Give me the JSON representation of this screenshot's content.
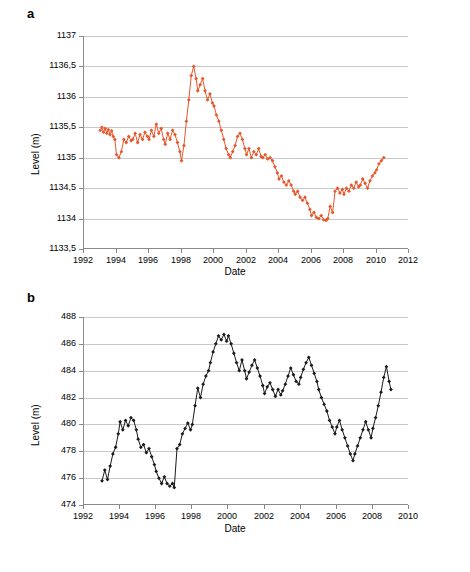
{
  "panels": {
    "a": {
      "letter": "a"
    },
    "b": {
      "letter": "b"
    }
  },
  "chart_data": [
    {
      "panel": "a",
      "type": "line",
      "title": "",
      "xlabel": "Date",
      "ylabel": "Level (m)",
      "xlim": [
        1992,
        2012
      ],
      "ylim": [
        1133.5,
        1137
      ],
      "xticks": [
        "1992",
        "1994",
        "1996",
        "1998",
        "2000",
        "2002",
        "2004",
        "2006",
        "2008",
        "2010",
        "2012"
      ],
      "yticks": [
        "1133,5",
        "1134",
        "1134,5",
        "1135",
        "1135,5",
        "1136",
        "1136,5",
        "1137"
      ],
      "grid": true,
      "legend": "none",
      "color": "#E8572B",
      "marker": "diamond",
      "x": [
        1993.0,
        1993.1,
        1993.2,
        1993.3,
        1993.4,
        1993.5,
        1993.6,
        1993.7,
        1993.8,
        1993.9,
        1994.0,
        1994.15,
        1994.3,
        1994.45,
        1994.6,
        1994.75,
        1994.9,
        1995.0,
        1995.15,
        1995.3,
        1995.45,
        1995.6,
        1995.75,
        1995.9,
        1996.0,
        1996.15,
        1996.3,
        1996.45,
        1996.6,
        1996.75,
        1996.9,
        1997.0,
        1997.15,
        1997.3,
        1997.45,
        1997.6,
        1997.75,
        1997.9,
        1998.0,
        1998.15,
        1998.3,
        1998.45,
        1998.6,
        1998.75,
        1998.9,
        1999.0,
        1999.15,
        1999.3,
        1999.45,
        1999.6,
        1999.75,
        1999.9,
        2000.0,
        2000.15,
        2000.3,
        2000.45,
        2000.6,
        2000.75,
        2000.9,
        2001.0,
        2001.15,
        2001.3,
        2001.45,
        2001.6,
        2001.75,
        2001.9,
        2002.0,
        2002.15,
        2002.3,
        2002.45,
        2002.6,
        2002.75,
        2002.9,
        2003.0,
        2003.15,
        2003.3,
        2003.45,
        2003.6,
        2003.75,
        2003.9,
        2004.0,
        2004.15,
        2004.3,
        2004.45,
        2004.6,
        2004.75,
        2004.9,
        2005.0,
        2005.15,
        2005.3,
        2005.45,
        2005.6,
        2005.75,
        2005.9,
        2006.0,
        2006.15,
        2006.3,
        2006.45,
        2006.6,
        2006.75,
        2006.9,
        2007.0,
        2007.15,
        2007.3,
        2007.45,
        2007.6,
        2007.75,
        2007.9,
        2008.0,
        2008.15,
        2008.3,
        2008.45,
        2008.6,
        2008.75,
        2008.9,
        2009.0,
        2009.15,
        2009.3,
        2009.45,
        2009.6,
        2009.75,
        2009.9,
        2010.0,
        2010.15,
        2010.3,
        2010.45
      ],
      "values": [
        1135.45,
        1135.5,
        1135.42,
        1135.48,
        1135.4,
        1135.46,
        1135.38,
        1135.44,
        1135.35,
        1135.3,
        1135.05,
        1135.0,
        1135.1,
        1135.3,
        1135.25,
        1135.35,
        1135.28,
        1135.3,
        1135.4,
        1135.25,
        1135.38,
        1135.3,
        1135.42,
        1135.35,
        1135.3,
        1135.45,
        1135.35,
        1135.55,
        1135.4,
        1135.48,
        1135.3,
        1135.22,
        1135.4,
        1135.3,
        1135.45,
        1135.38,
        1135.25,
        1135.1,
        1134.95,
        1135.2,
        1135.6,
        1135.95,
        1136.35,
        1136.5,
        1136.3,
        1136.1,
        1136.2,
        1136.3,
        1136.1,
        1135.95,
        1136.05,
        1135.9,
        1135.85,
        1135.7,
        1135.6,
        1135.45,
        1135.3,
        1135.15,
        1135.05,
        1135.0,
        1135.1,
        1135.2,
        1135.35,
        1135.4,
        1135.3,
        1135.15,
        1135.05,
        1135.15,
        1135.0,
        1135.1,
        1135.05,
        1135.15,
        1135.02,
        1135.0,
        1135.05,
        1134.98,
        1135.0,
        1134.95,
        1134.85,
        1134.75,
        1134.65,
        1134.7,
        1134.6,
        1134.55,
        1134.62,
        1134.55,
        1134.45,
        1134.4,
        1134.45,
        1134.35,
        1134.3,
        1134.35,
        1134.25,
        1134.15,
        1134.05,
        1134.1,
        1134.02,
        1134.0,
        1134.05,
        1133.98,
        1133.97,
        1134.0,
        1134.2,
        1134.1,
        1134.45,
        1134.5,
        1134.42,
        1134.48,
        1134.4,
        1134.5,
        1134.45,
        1134.55,
        1134.5,
        1134.6,
        1134.52,
        1134.55,
        1134.65,
        1134.58,
        1134.5,
        1134.62,
        1134.7,
        1134.75,
        1134.8,
        1134.9,
        1134.95,
        1135.0
      ]
    },
    {
      "panel": "b",
      "type": "line",
      "title": "",
      "xlabel": "Date",
      "ylabel": "Level (m)",
      "xlim": [
        1992,
        2010
      ],
      "ylim": [
        474,
        488
      ],
      "xticks": [
        "1992",
        "1994",
        "1996",
        "1998",
        "2000",
        "2002",
        "2004",
        "2006",
        "2008",
        "2010"
      ],
      "yticks": [
        "474",
        "476",
        "478",
        "480",
        "482",
        "484",
        "486",
        "488"
      ],
      "grid": true,
      "legend": "none",
      "color": "#1a1a1a",
      "marker": "diamond",
      "x": [
        1993.0,
        1993.15,
        1993.3,
        1993.45,
        1993.6,
        1993.75,
        1993.9,
        1994.0,
        1994.15,
        1994.3,
        1994.45,
        1994.6,
        1994.75,
        1994.9,
        1995.0,
        1995.15,
        1995.3,
        1995.45,
        1995.6,
        1995.75,
        1995.9,
        1996.0,
        1996.15,
        1996.3,
        1996.45,
        1996.6,
        1996.75,
        1996.9,
        1997.0,
        1997.15,
        1997.3,
        1997.45,
        1997.6,
        1997.75,
        1997.9,
        1998.0,
        1998.15,
        1998.3,
        1998.45,
        1998.6,
        1998.75,
        1998.9,
        1999.0,
        1999.15,
        1999.3,
        1999.45,
        1999.6,
        1999.75,
        1999.9,
        2000.0,
        2000.15,
        2000.3,
        2000.45,
        2000.6,
        2000.75,
        2000.9,
        2001.0,
        2001.15,
        2001.3,
        2001.45,
        2001.6,
        2001.75,
        2001.9,
        2002.0,
        2002.15,
        2002.3,
        2002.45,
        2002.6,
        2002.75,
        2002.9,
        2003.0,
        2003.15,
        2003.3,
        2003.45,
        2003.6,
        2003.75,
        2003.9,
        2004.0,
        2004.15,
        2004.3,
        2004.45,
        2004.6,
        2004.75,
        2004.9,
        2005.0,
        2005.15,
        2005.3,
        2005.45,
        2005.6,
        2005.75,
        2005.9,
        2006.0,
        2006.15,
        2006.3,
        2006.45,
        2006.6,
        2006.75,
        2006.9,
        2007.0,
        2007.15,
        2007.3,
        2007.45,
        2007.6,
        2007.75,
        2007.9,
        2008.0,
        2008.15,
        2008.3,
        2008.45,
        2008.6,
        2008.75,
        2008.9,
        2009.0
      ],
      "values": [
        475.8,
        476.6,
        475.9,
        476.9,
        477.8,
        478.3,
        479.3,
        480.2,
        479.6,
        480.3,
        479.9,
        480.5,
        480.3,
        479.6,
        478.9,
        478.3,
        478.5,
        477.9,
        478.2,
        477.6,
        477.0,
        476.5,
        476.0,
        475.6,
        476.1,
        475.6,
        475.4,
        475.6,
        475.3,
        478.2,
        478.5,
        479.3,
        479.7,
        480.1,
        479.6,
        480.0,
        481.4,
        482.7,
        482.0,
        483.0,
        483.6,
        484.0,
        484.6,
        485.4,
        486.0,
        486.6,
        486.3,
        486.7,
        486.2,
        486.6,
        486.0,
        485.3,
        484.6,
        484.0,
        484.8,
        484.0,
        483.4,
        483.9,
        484.4,
        484.8,
        484.2,
        483.6,
        482.9,
        482.3,
        482.8,
        483.1,
        482.6,
        482.1,
        482.6,
        482.2,
        482.5,
        483.0,
        483.6,
        484.2,
        483.7,
        483.2,
        483.0,
        483.5,
        484.1,
        484.6,
        485.0,
        484.4,
        483.8,
        483.2,
        482.6,
        482.0,
        481.5,
        481.0,
        480.3,
        479.8,
        479.3,
        479.8,
        480.3,
        479.6,
        479.0,
        478.4,
        477.8,
        477.3,
        477.8,
        478.4,
        479.0,
        479.6,
        480.2,
        479.6,
        479.0,
        479.7,
        480.5,
        481.4,
        482.4,
        483.5,
        484.3,
        483.2,
        482.6
      ]
    }
  ]
}
